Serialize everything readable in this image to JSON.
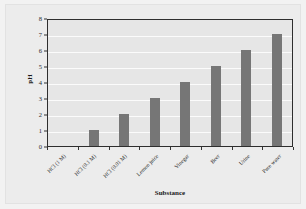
{
  "chart_data": {
    "type": "bar",
    "title": "",
    "xlabel": "Substance",
    "ylabel": "pH",
    "categories": [
      "HCl (1 M)",
      "HCl (0.1 M)",
      "HCl (0.01 M)",
      "Lemon juice",
      "Vinegar",
      "Beer",
      "Urine",
      "Pure water"
    ],
    "values": [
      0,
      1,
      2,
      3,
      4,
      5,
      6,
      7
    ],
    "ylim": [
      0,
      8
    ],
    "ytick_labels": [
      "0",
      "1",
      "2",
      "3",
      "4",
      "5",
      "6",
      "7",
      "8"
    ],
    "grid": true,
    "legend": "none",
    "bar_color": "#767676",
    "plot_background": "#e6e6e6",
    "figure_background": "#ececec",
    "gridline_color": "#fbfbfb",
    "axis_color": "#2e2e2e"
  }
}
